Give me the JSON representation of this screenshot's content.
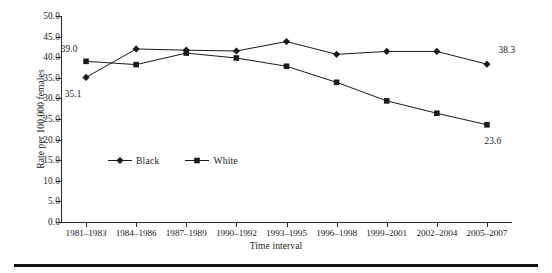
{
  "chart_data": {
    "type": "line",
    "title": "",
    "xlabel": "Time interval",
    "ylabel": "Rate per 100,000 females",
    "categories": [
      "1981–1983",
      "1984–1986",
      "1987–1989",
      "1990–1992",
      "1993–1995",
      "1996–1998",
      "1999–2001",
      "2002–2004",
      "2005–2007"
    ],
    "ylim": [
      0.0,
      50.0
    ],
    "ytick_step": 5.0,
    "ytick_labels": [
      "50.0",
      "45.0",
      "40.0",
      "35.0",
      "30.0",
      "25.0",
      "20.0",
      "15.0",
      "10.0",
      "5.0",
      "0.0"
    ],
    "grid": false,
    "legend_position": "inside-lower-left",
    "series": [
      {
        "name": "Black",
        "marker": "diamond",
        "color": "#1a1a1a",
        "values": [
          35.1,
          42.0,
          41.7,
          41.5,
          43.8,
          40.7,
          41.4,
          41.4,
          38.3
        ]
      },
      {
        "name": "White",
        "marker": "square",
        "color": "#1a1a1a",
        "values": [
          39.0,
          38.2,
          41.0,
          39.8,
          37.8,
          33.9,
          29.4,
          26.4,
          23.6
        ]
      }
    ],
    "annotations": [
      {
        "text": "39.0",
        "series": "White",
        "index": 0,
        "position": "above-left"
      },
      {
        "text": "35.1",
        "series": "Black",
        "index": 0,
        "position": "below-left"
      },
      {
        "text": "38.3",
        "series": "Black",
        "index": 8,
        "position": "above-right"
      },
      {
        "text": "23.6",
        "series": "White",
        "index": 8,
        "position": "below-right"
      }
    ]
  },
  "legend": {
    "items": [
      {
        "label": "Black",
        "marker": "diamond"
      },
      {
        "label": "White",
        "marker": "square"
      }
    ]
  }
}
